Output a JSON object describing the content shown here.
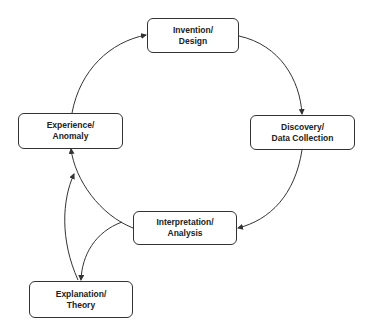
{
  "diagram": {
    "type": "cycle",
    "nodes": [
      {
        "id": "invention",
        "line1": "Invention/",
        "line2": "Design"
      },
      {
        "id": "discovery",
        "line1": "Discovery/",
        "line2": "Data Collection"
      },
      {
        "id": "interpretation",
        "line1": "Interpretation/",
        "line2": "Analysis"
      },
      {
        "id": "experience",
        "line1": "Experience/",
        "line2": "Anomaly"
      },
      {
        "id": "explanation",
        "line1": "Explanation/",
        "line2": "Theory"
      }
    ],
    "edges": [
      {
        "from": "experience",
        "to": "invention"
      },
      {
        "from": "invention",
        "to": "discovery"
      },
      {
        "from": "discovery",
        "to": "interpretation"
      },
      {
        "from": "interpretation",
        "to": "experience"
      },
      {
        "from": "interpretation",
        "to": "explanation"
      },
      {
        "from": "explanation",
        "to": "experience"
      }
    ],
    "colors": {
      "stroke": "#333333",
      "text": "#222222",
      "background": "#ffffff"
    }
  }
}
